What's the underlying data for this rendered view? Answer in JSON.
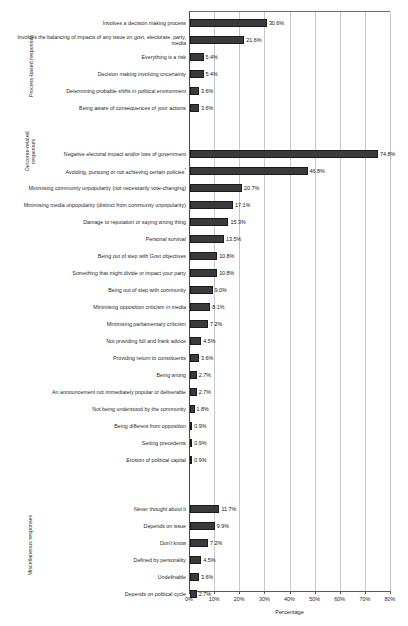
{
  "chart_data": {
    "type": "bar",
    "orientation": "horizontal",
    "title": "",
    "xlabel": "Percentage",
    "ylabel": "",
    "xlim": [
      0,
      80
    ],
    "xticks": [
      "0%",
      "10%",
      "20%",
      "30%",
      "40%",
      "50%",
      "60%",
      "70%",
      "80%"
    ],
    "xtick_values": [
      0,
      10,
      20,
      30,
      40,
      50,
      60,
      70,
      80
    ],
    "grid": "vertical",
    "legend": "none",
    "value_label_suffix": "%",
    "bar_color": "#3a3a3a",
    "groups": [
      {
        "name": "Process-based responses",
        "categories": [
          "Involves a decision making process",
          "Involves the balancing of impacts of any issue on govt, electorate, party, media",
          "Everything is a risk",
          "Decision making involving uncertainty",
          "Determining probable shifts in political environment",
          "Being aware of consequences of your actions"
        ],
        "values": [
          30.6,
          21.6,
          5.4,
          5.4,
          3.6,
          3.6
        ],
        "value_labels": [
          "30.6%",
          "21.6%",
          "5.4%",
          "5.4%",
          "3.6%",
          "3.6%"
        ]
      },
      {
        "name": "Outcome-related responses",
        "categories": [
          "Negative electoral impact and/or loss of government",
          "Avoiding, pursuing or not achieving certain policies*",
          "Minimising community unpopularity (not necessarily vote-changing)",
          "Minimising media unpopularity (distinct from community unpopularity)",
          "Damage to reputation or saying wrong thing",
          "Personal survival",
          "Being out of step with Govt objectives",
          "Something that might divide or impact your party",
          "Being out of step with community",
          "Minimising opposition criticism in media",
          "Minimising parliamentary criticism",
          "Not providing full and frank advice",
          "Providing return to constituents",
          "Being wrong",
          "An announcement not immediately popular or deliverable",
          "Not being understood by the community",
          "Being different from opposition",
          "Setting precedents",
          "Erosion of political capital"
        ],
        "values": [
          74.8,
          46.8,
          20.7,
          17.1,
          15.3,
          13.5,
          10.8,
          10.8,
          9.0,
          8.1,
          7.2,
          4.5,
          3.6,
          2.7,
          2.7,
          1.8,
          0.9,
          0.9,
          0.9
        ],
        "value_labels": [
          "74.8%",
          "46.8%",
          "20.7%",
          "17.1%",
          "15.3%",
          "13.5%",
          "10.8%",
          "10.8%",
          "9.0%",
          "8.1%",
          "7.2%",
          "4.5%",
          "3.6%",
          "2.7%",
          "2.7%",
          "1.8%",
          "0.9%",
          "0.9%",
          "0.9%"
        ]
      },
      {
        "name": "Miscellaneous responses",
        "categories": [
          "Never thought about it",
          "Depends on issue",
          "Don't know",
          "Defined by personality",
          "Undefinable",
          "Depends on political cycle"
        ],
        "values": [
          11.7,
          9.9,
          7.2,
          4.5,
          3.6,
          2.7
        ],
        "value_labels": [
          "11.7%",
          "9.9%",
          "7.2%",
          "4.5%",
          "3.6%",
          "2.7%"
        ]
      }
    ]
  },
  "axis": {
    "group_labels": [
      "Process-based responses",
      "Outcome-related responses",
      "Miscellaneous responses"
    ],
    "x_title": "Percentage"
  }
}
